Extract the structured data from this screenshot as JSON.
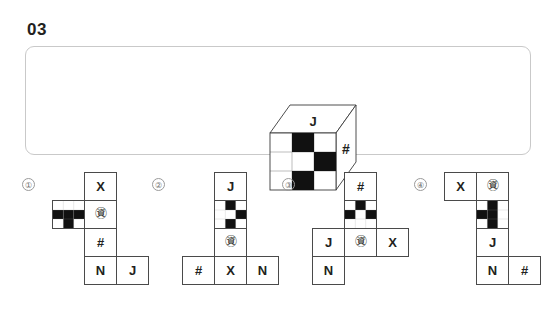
{
  "header": {
    "question_number": "03"
  },
  "prompt": {
    "cube": {
      "top_face_label": "J",
      "right_face_label": "#",
      "front_face": {
        "grid_size": 3,
        "black_cells": [
          [
            0,
            1
          ],
          [
            1,
            2
          ],
          [
            2,
            1
          ]
        ]
      }
    }
  },
  "options": [
    {
      "marker": "①",
      "cells": [
        {
          "row": 0,
          "col": 1,
          "type": "text",
          "label": "X"
        },
        {
          "row": 1,
          "col": 0,
          "type": "pattern",
          "black_cells": [
            [
              1,
              0
            ],
            [
              1,
              1
            ],
            [
              1,
              2
            ],
            [
              2,
              1
            ]
          ]
        },
        {
          "row": 1,
          "col": 1,
          "type": "text",
          "label": "㊮"
        },
        {
          "row": 2,
          "col": 1,
          "type": "text",
          "label": "#"
        },
        {
          "row": 3,
          "col": 1,
          "type": "text",
          "label": "N"
        },
        {
          "row": 3,
          "col": 2,
          "type": "text",
          "label": "J"
        }
      ]
    },
    {
      "marker": "②",
      "cells": [
        {
          "row": 0,
          "col": 1,
          "type": "text",
          "label": "J"
        },
        {
          "row": 1,
          "col": 1,
          "type": "pattern",
          "black_cells": [
            [
              0,
              1
            ],
            [
              1,
              2
            ],
            [
              2,
              1
            ]
          ]
        },
        {
          "row": 2,
          "col": 1,
          "type": "text",
          "label": "㊮"
        },
        {
          "row": 3,
          "col": 0,
          "type": "text",
          "label": "#"
        },
        {
          "row": 3,
          "col": 1,
          "type": "text",
          "label": "X"
        },
        {
          "row": 3,
          "col": 2,
          "type": "text",
          "label": "N"
        }
      ]
    },
    {
      "marker": "③",
      "cells": [
        {
          "row": 0,
          "col": 1,
          "type": "text",
          "label": "#"
        },
        {
          "row": 1,
          "col": 1,
          "type": "pattern",
          "black_cells": [
            [
              0,
              1
            ],
            [
              1,
              0
            ],
            [
              1,
              2
            ]
          ]
        },
        {
          "row": 2,
          "col": 0,
          "type": "text",
          "label": "J"
        },
        {
          "row": 2,
          "col": 1,
          "type": "text",
          "label": "㊮"
        },
        {
          "row": 2,
          "col": 2,
          "type": "text",
          "label": "X"
        },
        {
          "row": 3,
          "col": 0,
          "type": "text",
          "label": "N"
        }
      ]
    },
    {
      "marker": "④",
      "cells": [
        {
          "row": 0,
          "col": 0,
          "type": "text",
          "label": "X"
        },
        {
          "row": 0,
          "col": 1,
          "type": "text",
          "label": "㊮"
        },
        {
          "row": 1,
          "col": 1,
          "type": "pattern",
          "black_cells": [
            [
              0,
              1
            ],
            [
              1,
              0
            ],
            [
              1,
              1
            ],
            [
              2,
              1
            ]
          ]
        },
        {
          "row": 2,
          "col": 1,
          "type": "text",
          "label": "J"
        },
        {
          "row": 3,
          "col": 1,
          "type": "text",
          "label": "N"
        },
        {
          "row": 3,
          "col": 2,
          "type": "text",
          "label": "#"
        }
      ]
    }
  ],
  "style": {
    "panel_border": "#c9c9c9",
    "cell_border": "#4a4a4a",
    "ink": "#231f20",
    "marker_color": "#6d6d6d"
  }
}
